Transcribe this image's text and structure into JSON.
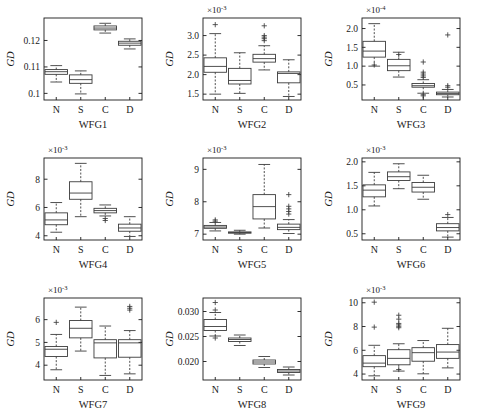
{
  "figure": {
    "title": "",
    "rows": 3,
    "cols": 3,
    "ylabel": "GD",
    "group_labels": [
      "N",
      "S",
      "C",
      "D"
    ]
  },
  "chart_data": [
    {
      "type": "box",
      "id": "WFG1",
      "xlabel": "WFG1",
      "ylabel": "GD",
      "exponent": "",
      "ylim": [
        0.0975,
        0.1285
      ],
      "yticks": [
        0.1,
        0.11,
        0.12
      ],
      "ytick_labels": [
        "0.1",
        "0.11",
        "0.12"
      ],
      "categories": [
        "N",
        "S",
        "C",
        "D"
      ],
      "boxes": [
        {
          "label": "N",
          "whisker_low": 0.1043,
          "q1": 0.1072,
          "median": 0.1082,
          "q3": 0.109,
          "whisker_high": 0.1105,
          "outliers": []
        },
        {
          "label": "S",
          "whisker_low": 0.0998,
          "q1": 0.1038,
          "median": 0.1052,
          "q3": 0.107,
          "whisker_high": 0.1085,
          "outliers": []
        },
        {
          "label": "C",
          "whisker_low": 0.1228,
          "q1": 0.124,
          "median": 0.1247,
          "q3": 0.1255,
          "whisker_high": 0.1265,
          "outliers": []
        },
        {
          "label": "D",
          "whisker_low": 0.1168,
          "q1": 0.1182,
          "median": 0.119,
          "q3": 0.1197,
          "whisker_high": 0.1206,
          "outliers": []
        }
      ]
    },
    {
      "type": "box",
      "id": "WFG2",
      "xlabel": "WFG2",
      "ylabel": "GD",
      "exponent": "-3",
      "ylim": [
        1.35,
        3.45
      ],
      "yticks": [
        1.5,
        2.0,
        2.5,
        3.0
      ],
      "ytick_labels": [
        "1.5",
        "2.0",
        "2.5",
        "3.0"
      ],
      "categories": [
        "N",
        "S",
        "C",
        "D"
      ],
      "boxes": [
        {
          "label": "N",
          "whisker_low": 1.5,
          "q1": 2.06,
          "median": 2.21,
          "q3": 2.43,
          "whisker_high": 3.05,
          "outliers": [
            3.28
          ]
        },
        {
          "label": "S",
          "whisker_low": 1.52,
          "q1": 1.76,
          "median": 1.85,
          "q3": 2.16,
          "whisker_high": 2.56,
          "outliers": []
        },
        {
          "label": "C",
          "whisker_low": 2.12,
          "q1": 2.32,
          "median": 2.41,
          "q3": 2.52,
          "whisker_high": 2.74,
          "outliers": [
            2.87,
            2.92,
            2.96,
            3.0,
            3.25
          ]
        },
        {
          "label": "D",
          "whisker_low": 1.44,
          "q1": 1.79,
          "median": 2.03,
          "q3": 2.07,
          "whisker_high": 2.38,
          "outliers": []
        }
      ]
    },
    {
      "type": "box",
      "id": "WFG3",
      "xlabel": "WFG3",
      "ylabel": "GD",
      "exponent": "-4",
      "ylim": [
        0.1,
        2.28
      ],
      "yticks": [
        0.5,
        1.0,
        1.5,
        2.0
      ],
      "ytick_labels": [
        "0.5",
        "1.0",
        "1.5",
        "2.0"
      ],
      "categories": [
        "N",
        "S",
        "C",
        "D"
      ],
      "boxes": [
        {
          "label": "N",
          "whisker_low": 1.0,
          "q1": 1.24,
          "median": 1.4,
          "q3": 1.66,
          "whisker_high": 2.13,
          "outliers": [
            1.03
          ]
        },
        {
          "label": "S",
          "whisker_low": 0.71,
          "q1": 0.88,
          "median": 1.01,
          "q3": 1.18,
          "whisker_high": 1.37,
          "outliers": [
            1.31
          ]
        },
        {
          "label": "C",
          "whisker_low": 0.28,
          "q1": 0.44,
          "median": 0.48,
          "q3": 0.54,
          "whisker_high": 0.64,
          "outliers": [
            0.7,
            0.74,
            0.79,
            0.84,
            1.11,
            0.24,
            0.21
          ]
        },
        {
          "label": "D",
          "whisker_low": 0.18,
          "q1": 0.24,
          "median": 0.27,
          "q3": 0.31,
          "whisker_high": 0.38,
          "outliers": [
            0.44,
            0.48,
            1.83
          ]
        }
      ]
    },
    {
      "type": "box",
      "id": "WFG4",
      "xlabel": "WFG4",
      "ylabel": "GD",
      "exponent": "-3",
      "ylim": [
        3.7,
        9.5
      ],
      "yticks": [
        4,
        6,
        8
      ],
      "ytick_labels": [
        "4",
        "6",
        "8"
      ],
      "categories": [
        "N",
        "S",
        "C",
        "D"
      ],
      "boxes": [
        {
          "label": "N",
          "whisker_low": 4.25,
          "q1": 4.78,
          "median": 5.12,
          "q3": 5.62,
          "whisker_high": 6.35,
          "outliers": []
        },
        {
          "label": "S",
          "whisker_low": 5.35,
          "q1": 6.58,
          "median": 7.02,
          "q3": 7.82,
          "whisker_high": 9.12,
          "outliers": []
        },
        {
          "label": "C",
          "whisker_low": 5.4,
          "q1": 5.62,
          "median": 5.78,
          "q3": 5.94,
          "whisker_high": 6.18,
          "outliers": [
            5.22,
            5.08
          ]
        },
        {
          "label": "D",
          "whisker_low": 3.95,
          "q1": 4.32,
          "median": 4.55,
          "q3": 4.82,
          "whisker_high": 5.35,
          "outliers": []
        }
      ]
    },
    {
      "type": "box",
      "id": "WFG5",
      "xlabel": "WFG5",
      "ylabel": "GD",
      "exponent": "-3",
      "ylim": [
        6.82,
        9.35
      ],
      "yticks": [
        7,
        8,
        9
      ],
      "ytick_labels": [
        "7",
        "8",
        "9"
      ],
      "categories": [
        "N",
        "S",
        "C",
        "D"
      ],
      "boxes": [
        {
          "label": "N",
          "whisker_low": 7.1,
          "q1": 7.18,
          "median": 7.22,
          "q3": 7.27,
          "whisker_high": 7.36,
          "outliers": [
            7.4,
            7.44
          ]
        },
        {
          "label": "S",
          "whisker_low": 7.0,
          "q1": 7.03,
          "median": 7.05,
          "q3": 7.07,
          "whisker_high": 7.12,
          "outliers": []
        },
        {
          "label": "C",
          "whisker_low": 7.19,
          "q1": 7.47,
          "median": 7.85,
          "q3": 8.22,
          "whisker_high": 9.15,
          "outliers": []
        },
        {
          "label": "D",
          "whisker_low": 7.02,
          "q1": 7.14,
          "median": 7.21,
          "q3": 7.31,
          "whisker_high": 7.45,
          "outliers": [
            7.62,
            7.7,
            7.78,
            7.86,
            8.22
          ]
        }
      ]
    },
    {
      "type": "box",
      "id": "WFG6",
      "xlabel": "WFG6",
      "ylabel": "GD",
      "exponent": "-3",
      "ylim": [
        0.37,
        2.08
      ],
      "yticks": [
        0.5,
        1.0,
        1.5,
        2.0
      ],
      "ytick_labels": [
        "0.5",
        "1.0",
        "1.5",
        "2.0"
      ],
      "categories": [
        "N",
        "S",
        "C",
        "D"
      ],
      "boxes": [
        {
          "label": "N",
          "whisker_low": 1.08,
          "q1": 1.27,
          "median": 1.41,
          "q3": 1.52,
          "whisker_high": 1.78,
          "outliers": []
        },
        {
          "label": "S",
          "whisker_low": 1.44,
          "q1": 1.61,
          "median": 1.69,
          "q3": 1.79,
          "whisker_high": 1.96,
          "outliers": []
        },
        {
          "label": "C",
          "whisker_low": 1.22,
          "q1": 1.37,
          "median": 1.47,
          "q3": 1.57,
          "whisker_high": 1.72,
          "outliers": []
        },
        {
          "label": "D",
          "whisker_low": 0.43,
          "q1": 0.56,
          "median": 0.63,
          "q3": 0.71,
          "whisker_high": 0.84,
          "outliers": [
            0.9
          ]
        }
      ]
    },
    {
      "type": "box",
      "id": "WFG7",
      "xlabel": "WFG7",
      "ylabel": "GD",
      "exponent": "-3",
      "ylim": [
        3.35,
        6.95
      ],
      "yticks": [
        4,
        5,
        6
      ],
      "ytick_labels": [
        "4",
        "5",
        "6"
      ],
      "categories": [
        "N",
        "S",
        "C",
        "D"
      ],
      "boxes": [
        {
          "label": "N",
          "whisker_low": 3.8,
          "q1": 4.38,
          "median": 4.7,
          "q3": 4.82,
          "whisker_high": 5.35,
          "outliers": [
            5.88
          ]
        },
        {
          "label": "S",
          "whisker_low": 4.62,
          "q1": 5.2,
          "median": 5.62,
          "q3": 5.96,
          "whisker_high": 6.55,
          "outliers": []
        },
        {
          "label": "C",
          "whisker_low": 3.55,
          "q1": 4.32,
          "median": 4.98,
          "q3": 5.12,
          "whisker_high": 5.72,
          "outliers": []
        },
        {
          "label": "D",
          "whisker_low": 3.62,
          "q1": 4.35,
          "median": 4.98,
          "q3": 5.12,
          "whisker_high": 5.52,
          "outliers": [
            6.42,
            6.5,
            6.58
          ]
        }
      ]
    },
    {
      "type": "box",
      "id": "WFG8",
      "xlabel": "WFG8",
      "ylabel": "GD",
      "exponent": "",
      "ylim": [
        0.0163,
        0.0327
      ],
      "yticks": [
        0.02,
        0.025,
        0.03
      ],
      "ytick_labels": [
        "0.020",
        "0.025",
        "0.030"
      ],
      "categories": [
        "N",
        "S",
        "C",
        "D"
      ],
      "boxes": [
        {
          "label": "N",
          "whisker_low": 0.0251,
          "q1": 0.0262,
          "median": 0.027,
          "q3": 0.0284,
          "whisker_high": 0.0298,
          "outliers": [
            0.0303,
            0.0318,
            0.0247
          ]
        },
        {
          "label": "S",
          "whisker_low": 0.0232,
          "q1": 0.024,
          "median": 0.0244,
          "q3": 0.0247,
          "whisker_high": 0.0253,
          "outliers": []
        },
        {
          "label": "C",
          "whisker_low": 0.0188,
          "q1": 0.0195,
          "median": 0.0199,
          "q3": 0.0203,
          "whisker_high": 0.021,
          "outliers": []
        },
        {
          "label": "D",
          "whisker_low": 0.0173,
          "q1": 0.0178,
          "median": 0.0181,
          "q3": 0.0184,
          "whisker_high": 0.0189,
          "outliers": []
        }
      ]
    },
    {
      "type": "box",
      "id": "WFG9",
      "xlabel": "WFG9",
      "ylabel": "GD",
      "exponent": "-3",
      "ylim": [
        3.5,
        10.4
      ],
      "yticks": [
        4,
        6,
        8,
        10
      ],
      "ytick_labels": [
        "4",
        "6",
        "8",
        "10"
      ],
      "categories": [
        "N",
        "S",
        "C",
        "D"
      ],
      "boxes": [
        {
          "label": "N",
          "whisker_low": 3.85,
          "q1": 4.62,
          "median": 4.92,
          "q3": 5.55,
          "whisker_high": 6.42,
          "outliers": [
            7.95,
            10.05
          ]
        },
        {
          "label": "S",
          "whisker_low": 4.25,
          "q1": 4.78,
          "median": 5.32,
          "q3": 6.05,
          "whisker_high": 6.55,
          "outliers": [
            7.9,
            8.02,
            8.14,
            8.26,
            8.62,
            8.95,
            4.38
          ]
        },
        {
          "label": "C",
          "whisker_low": 4.02,
          "q1": 5.08,
          "median": 5.8,
          "q3": 6.22,
          "whisker_high": 6.82,
          "outliers": []
        },
        {
          "label": "D",
          "whisker_low": 4.52,
          "q1": 5.32,
          "median": 5.85,
          "q3": 6.48,
          "whisker_high": 7.85,
          "outliers": []
        }
      ]
    }
  ]
}
